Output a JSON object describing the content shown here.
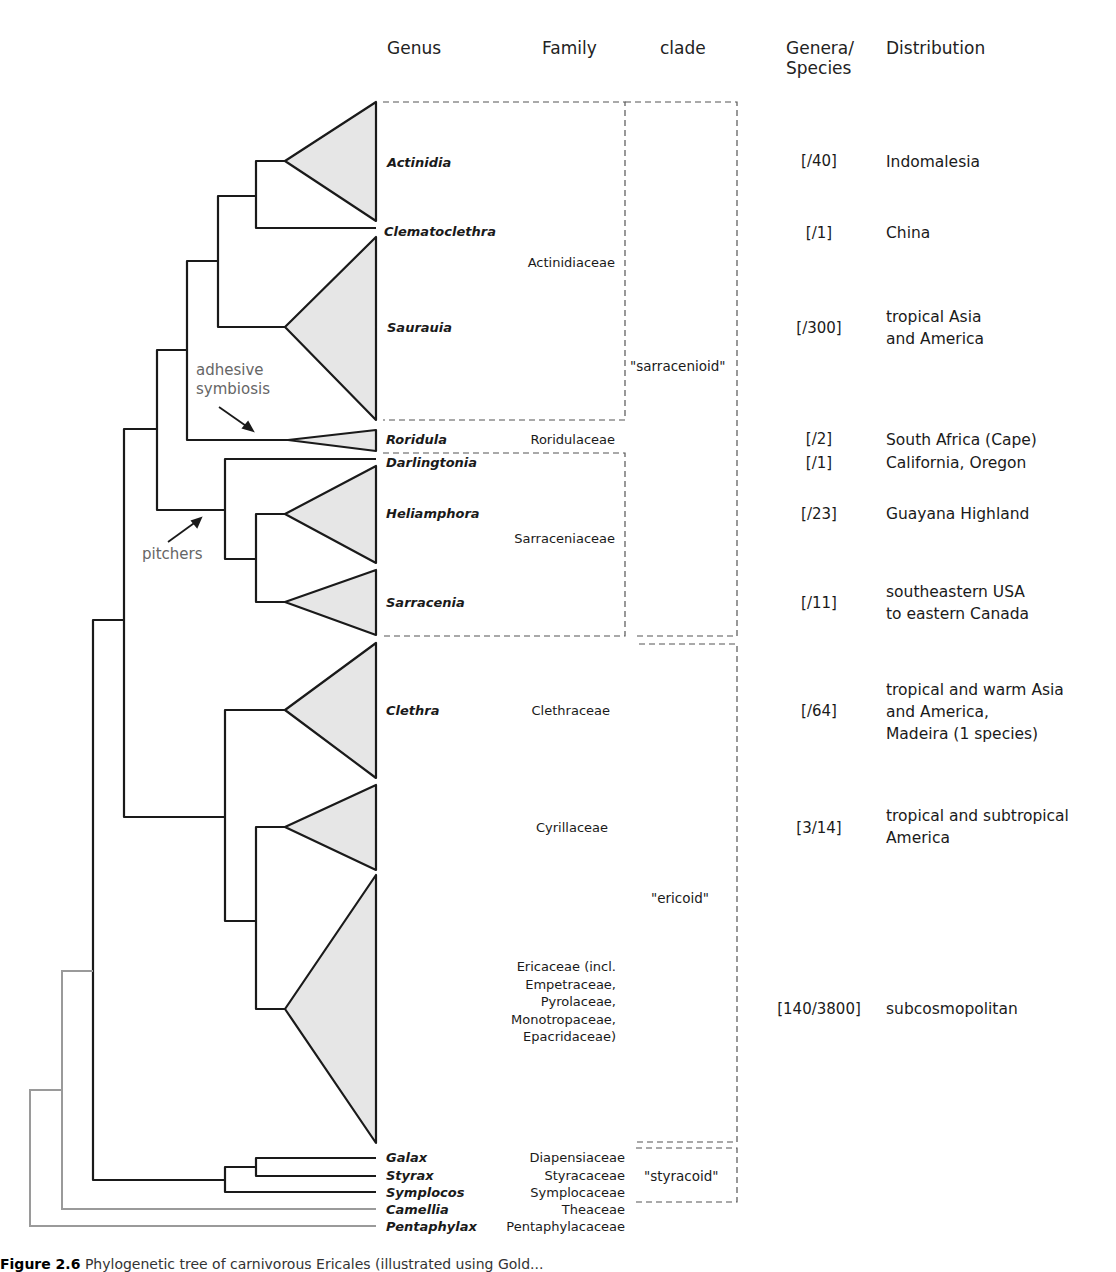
{
  "headers": {
    "genus": "Genus",
    "family": "Family",
    "clade": "clade",
    "genera_species_1": "Genera/",
    "genera_species_2": "Species",
    "distribution": "Distribution"
  },
  "taxa": [
    {
      "genus": "Actinidia",
      "counts": "[/40]",
      "distribution": [
        "Indomalesia"
      ]
    },
    {
      "genus": "Clematoclethra",
      "counts": "[/1]",
      "distribution": [
        "China"
      ]
    },
    {
      "genus": "Saurauia",
      "counts": "[/300]",
      "distribution": [
        "tropical Asia",
        "and America"
      ]
    },
    {
      "genus": "Roridula",
      "counts": "[/2]",
      "distribution": [
        "South Africa (Cape)"
      ]
    },
    {
      "genus": "Darlingtonia",
      "counts": "[/1]",
      "distribution": [
        "California, Oregon"
      ]
    },
    {
      "genus": "Heliamphora",
      "counts": "[/23]",
      "distribution": [
        "Guayana Highland"
      ]
    },
    {
      "genus": "Sarracenia",
      "counts": "[/11]",
      "distribution": [
        "southeastern USA",
        "to eastern Canada"
      ]
    },
    {
      "genus": "Clethra",
      "counts": "[/64]",
      "distribution": [
        "tropical and warm Asia",
        "and America,",
        "Madeira (1 species)"
      ]
    },
    {
      "genus": "",
      "counts": "[3/14]",
      "distribution": [
        "tropical and subtropical",
        "America"
      ]
    },
    {
      "genus": "",
      "counts": "[140/3800]",
      "distribution": [
        "subcosmopolitan"
      ]
    },
    {
      "genus": "Galax",
      "counts": "",
      "distribution": []
    },
    {
      "genus": "Styrax",
      "counts": "",
      "distribution": []
    },
    {
      "genus": "Symplocos",
      "counts": "",
      "distribution": []
    },
    {
      "genus": "Camellia",
      "counts": "",
      "distribution": []
    },
    {
      "genus": "Pentaphylax",
      "counts": "",
      "distribution": []
    }
  ],
  "families": {
    "actinidiaceae": "Actinidiaceae",
    "roridulaceae": "Roridulaceae",
    "sarraceniaceae": "Sarraceniaceae",
    "clethraceae": "Clethraceae",
    "cyrillaceae": "Cyrillaceae",
    "ericaceae": [
      "Ericaceae (incl.",
      "Empetraceae,",
      "Pyrolaceae,",
      "Monotropaceae,",
      "Epacridaceae)"
    ],
    "diapensiaceae": "Diapensiaceae",
    "styracaceae": "Styracaceae",
    "symplocaceae": "Symplocaceae",
    "theaceae": "Theaceae",
    "pentaphylacaceae": "Pentaphylacaceae"
  },
  "clades": {
    "sarracenioid": "\"sarracenioid\"",
    "ericoid": "\"ericoid\"",
    "styracoid": "\"styracoid\""
  },
  "annotations": {
    "adhesive_1": "adhesive",
    "adhesive_2": "symbiosis",
    "pitchers": "pitchers"
  },
  "caption": {
    "label": "Figure 2.6",
    "text": "Phylogenetic tree of carnivorous Ericales (illustrated using Gold..."
  },
  "colors": {
    "branch": "#1a1a1a",
    "outgroup_branch": "#9a9a9a",
    "triangle_fill": "#e6e6e6",
    "dash": "#555555",
    "annotation": "#666666"
  }
}
